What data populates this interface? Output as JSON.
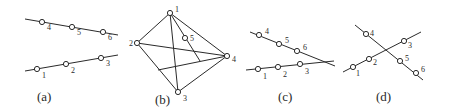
{
  "panels": [
    {
      "id": "a",
      "caption": "(a)",
      "caption_pos": [
        37,
        101
      ],
      "lines": [
        [
          25,
          19,
          118,
          35
        ],
        [
          25,
          71,
          118,
          55
        ]
      ],
      "points": [
        {
          "label": "4",
          "x": 42,
          "y": 22,
          "lx": 47,
          "ly": 30
        },
        {
          "label": "5",
          "x": 72,
          "y": 27,
          "lx": 77,
          "ly": 35
        },
        {
          "label": "6",
          "x": 103,
          "y": 32,
          "lx": 108,
          "ly": 40
        },
        {
          "label": "1",
          "x": 37,
          "y": 69,
          "lx": 42,
          "ly": 78
        },
        {
          "label": "2",
          "x": 66,
          "y": 64,
          "lx": 71,
          "ly": 73
        },
        {
          "label": "3",
          "x": 101,
          "y": 58,
          "lx": 106,
          "ly": 66
        }
      ]
    },
    {
      "id": "b",
      "caption": "(b)",
      "caption_pos": [
        155,
        104
      ],
      "lines": [
        [
          170,
          13,
          137,
          43
        ],
        [
          137,
          43,
          178,
          92
        ],
        [
          178,
          92,
          227,
          56
        ],
        [
          227,
          56,
          170,
          13
        ],
        [
          170,
          13,
          178,
          92
        ],
        [
          137,
          43,
          227,
          56
        ],
        [
          170,
          13,
          200,
          61
        ],
        [
          158,
          70,
          227,
          56
        ]
      ],
      "points": [
        {
          "label": "1",
          "x": 170,
          "y": 13,
          "lx": 175,
          "ly": 12
        },
        {
          "label": "2",
          "x": 137,
          "y": 43,
          "lx": 129,
          "ly": 46
        },
        {
          "label": "3",
          "x": 178,
          "y": 92,
          "lx": 183,
          "ly": 101
        },
        {
          "label": "4",
          "x": 227,
          "y": 56,
          "lx": 232,
          "ly": 62
        },
        {
          "label": "5",
          "x": 185,
          "y": 38,
          "lx": 190,
          "ly": 41
        }
      ]
    },
    {
      "id": "c",
      "caption": "(c)",
      "caption_pos": [
        278,
        101
      ],
      "lines": [
        [
          250,
          32,
          335,
          66
        ],
        [
          246,
          70,
          334,
          61
        ]
      ],
      "points": [
        {
          "label": "4",
          "x": 259,
          "y": 35,
          "lx": 265,
          "ly": 34
        },
        {
          "label": "5",
          "x": 279,
          "y": 44,
          "lx": 285,
          "ly": 43
        },
        {
          "label": "6",
          "x": 297,
          "y": 51,
          "lx": 303,
          "ly": 50
        },
        {
          "label": "1",
          "x": 258,
          "y": 69,
          "lx": 263,
          "ly": 79
        },
        {
          "label": "2",
          "x": 278,
          "y": 67,
          "lx": 283,
          "ly": 77
        },
        {
          "label": "3",
          "x": 300,
          "y": 64,
          "lx": 305,
          "ly": 74
        }
      ]
    },
    {
      "id": "d",
      "caption": "(d)",
      "caption_pos": [
        376,
        101
      ],
      "lines": [
        [
          355,
          25,
          423,
          80
        ],
        [
          343,
          72,
          421,
          32
        ]
      ],
      "points": [
        {
          "label": "4",
          "x": 366,
          "y": 34,
          "lx": 370,
          "ly": 36
        },
        {
          "label": "5",
          "x": 400,
          "y": 61,
          "lx": 405,
          "ly": 61
        },
        {
          "label": "6",
          "x": 416,
          "y": 73,
          "lx": 421,
          "ly": 72
        },
        {
          "label": "1",
          "x": 353,
          "y": 67,
          "lx": 356,
          "ly": 76
        },
        {
          "label": "2",
          "x": 369,
          "y": 59,
          "lx": 373,
          "ly": 65
        },
        {
          "label": "3",
          "x": 404,
          "y": 41,
          "lx": 408,
          "ly": 48
        }
      ]
    }
  ],
  "colors": {
    "stroke": "#2a2a2a",
    "background": "#ffffff"
  }
}
